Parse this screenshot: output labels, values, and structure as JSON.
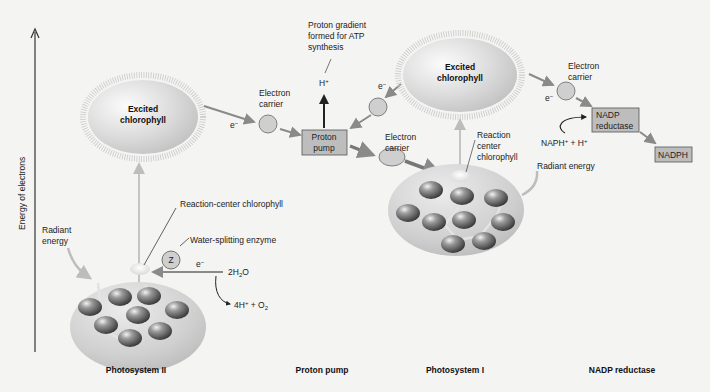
{
  "axis": {
    "label": "Energy of electrons"
  },
  "bottom_labels": {
    "ps2": "Photosystem II",
    "pump": "Proton pump",
    "ps1": "Photosystem I",
    "nadp": "NADP reductase"
  },
  "ps2": {
    "excited_line1": "Excited",
    "excited_line2": "chlorophyll",
    "rc_label": "Reaction-center chlorophyll",
    "radiant_line1": "Radiant",
    "radiant_line2": "energy",
    "enzyme_label": "Water-splitting enzyme",
    "enzyme_symbol": "Z",
    "electron": "e",
    "water": "2H",
    "water_sub": "2",
    "water_o": "O",
    "products_a": "4H",
    "products_b": " + O",
    "products_sub": "2"
  },
  "transport": {
    "electron_1": "e",
    "carrier1_line1": "Electron",
    "carrier1_line2": "carrier",
    "gradient_line1": "Proton gradient",
    "gradient_line2": "formed for ATP",
    "gradient_line3": "synthesis",
    "proton": "H",
    "pump_line1": "Proton",
    "pump_line2": "pump",
    "electron_2": "e",
    "carrier2_line1": "Electron",
    "carrier2_line2": "carrier"
  },
  "ps1": {
    "excited_line1": "Excited",
    "excited_line2": "chlorophyll",
    "rc_line1": "Reaction",
    "rc_line2": "center",
    "rc_line3": "chlorophyll",
    "radiant": "Radiant energy"
  },
  "nadp": {
    "electron": "e",
    "carrier_line1": "Electron",
    "carrier_line2": "carrier",
    "reductase_line1": "NADP",
    "reductase_line2": "reductase",
    "input": "NAPH",
    "input_b": " + H",
    "product": "NADPH"
  },
  "colors": {
    "arrow_gray": "#8a8a8a",
    "box_fill": "#bdbdbd",
    "carrier_fill": "#cfcfcf",
    "background": "#f4f4f3"
  }
}
